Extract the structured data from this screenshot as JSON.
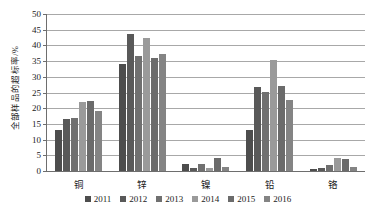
{
  "chart_data": {
    "type": "bar",
    "title": "",
    "xlabel": "",
    "ylabel": "全部样品的超标率/%",
    "ylim": [
      0,
      50
    ],
    "yticks": [
      0,
      5,
      10,
      15,
      20,
      25,
      30,
      35,
      40,
      45,
      50
    ],
    "grid": true,
    "legend_position": "bottom-center",
    "categories": [
      "铜",
      "锌",
      "镍",
      "铅",
      "铬"
    ],
    "series": [
      {
        "name": "2011",
        "color": "#4d4d4d",
        "values": [
          13.0,
          34.0,
          2.3,
          13.2,
          0.6
        ]
      },
      {
        "name": "2012",
        "color": "#595959",
        "values": [
          16.5,
          43.5,
          1.1,
          26.8,
          1.0
        ]
      },
      {
        "name": "2013",
        "color": "#707070",
        "values": [
          17.0,
          36.5,
          2.1,
          25.2,
          1.9
        ]
      },
      {
        "name": "2014",
        "color": "#9a9a9a",
        "values": [
          22.0,
          42.5,
          1.0,
          35.5,
          4.1
        ]
      },
      {
        "name": "2015",
        "color": "#6b6b6b",
        "values": [
          22.3,
          36.0,
          4.1,
          27.2,
          3.8
        ]
      },
      {
        "name": "2016",
        "color": "#848484",
        "values": [
          19.0,
          37.3,
          1.2,
          22.5,
          1.3
        ]
      }
    ]
  }
}
